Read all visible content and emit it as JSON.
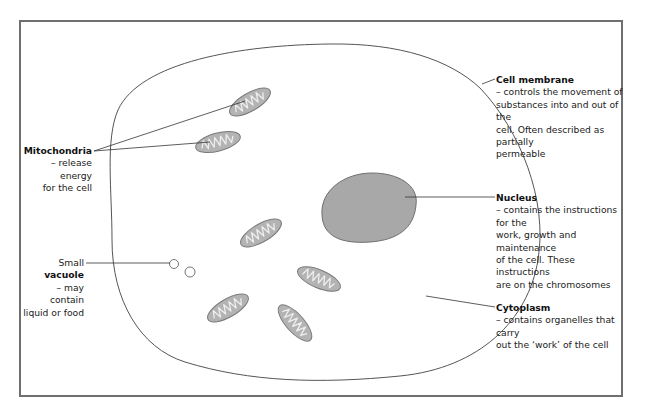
{
  "diagram": {
    "colors": {
      "border": "#6f6f6f",
      "membrane": "#555555",
      "organelle_fill": "#b3b3b3",
      "organelle_stroke": "#777777",
      "nucleus_fill": "#a8a8a8",
      "leader_line": "#333333"
    },
    "labels": {
      "mitochondria": {
        "title": "Mitochondria",
        "line1": "– release energy",
        "line2": "for the cell"
      },
      "cell_membrane": {
        "title": "Cell membrane",
        "line1": "– controls the movement of",
        "line2": "substances into and out of the",
        "line3": "cell. Often described as partially",
        "line4": "permeable"
      },
      "nucleus": {
        "title": "Nucleus",
        "line1": "– contains the instructions for the",
        "line2": "work, growth and maintenance",
        "line3": "of the cell. These instructions",
        "line4": "are on the chromosomes"
      },
      "vacuole": {
        "prefix": "Small ",
        "title": "vacuole",
        "line1": "– may contain",
        "line2": "liquid or food"
      },
      "cytoplasm": {
        "title": "Cytoplasm",
        "line1": "– contains organelles that carry",
        "line2": "out the ‘work’ of the cell"
      }
    }
  }
}
